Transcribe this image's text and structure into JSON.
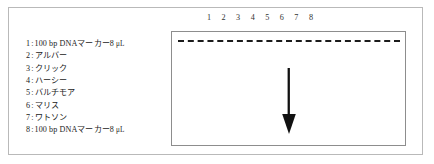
{
  "figure": {
    "background_color": "#ffffff",
    "frame_color": "#b9b9b9",
    "gel_border_color": "#8d8d8d",
    "well_color": "#1b1b1b",
    "arrow_color": "#111111"
  },
  "legend": {
    "items": [
      {
        "index": "1",
        "separator": ":",
        "text": "100 bp DNAマーカー8 ",
        "unit": "μL"
      },
      {
        "index": "2",
        "separator": ":",
        "text": "アルバー",
        "unit": ""
      },
      {
        "index": "3",
        "separator": ":",
        "text": "クリック",
        "unit": ""
      },
      {
        "index": "4",
        "separator": ":",
        "text": "ハーシー",
        "unit": ""
      },
      {
        "index": "5",
        "separator": ":",
        "text": "バルチモア",
        "unit": ""
      },
      {
        "index": "6",
        "separator": ":",
        "text": "マリス",
        "unit": ""
      },
      {
        "index": "7",
        "separator": ":",
        "text": "ワトソン",
        "unit": ""
      },
      {
        "index": "8",
        "separator": ":",
        "text": "100 bp DNAマーカー8 ",
        "unit": "μL"
      }
    ]
  },
  "gel": {
    "lane_numbers": [
      "1",
      "2",
      "3",
      "4",
      "5",
      "6",
      "7",
      "8"
    ],
    "wells_style": "dashed",
    "arrow_direction": "down",
    "arrow_meaning": "migration-direction"
  }
}
